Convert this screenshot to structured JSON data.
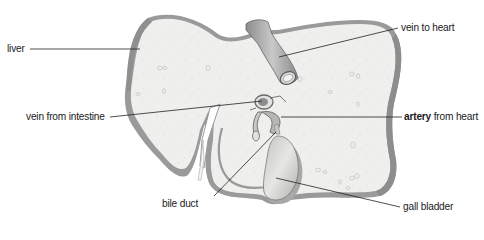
{
  "diagram": {
    "colors": {
      "background": "#ffffff",
      "liver_fill": "#efefed",
      "liver_rim": "#9a9a9a",
      "vessel_fill": "#b8b8b8",
      "vessel_dark": "#7a7a7a",
      "gall_bladder_fill": "#d8d8d6",
      "leader_line": "#222222",
      "text": "#1a1a1a"
    },
    "labels": {
      "liver": "liver",
      "vein_to_heart": "vein to heart",
      "vein_from_intestine": "vein from intestine",
      "artery_from_heart_bold": "artery",
      "artery_from_heart_rest": " from heart",
      "bile_duct": "bile duct",
      "gall_bladder": "gall bladder"
    },
    "parts": [
      {
        "name": "liver",
        "label": "liver"
      },
      {
        "name": "vein to heart",
        "label": "vein to heart"
      },
      {
        "name": "vein from intestine",
        "label": "vein from intestine"
      },
      {
        "name": "artery from heart",
        "label": "artery from heart",
        "emphasis": "artery"
      },
      {
        "name": "bile duct",
        "label": "bile duct"
      },
      {
        "name": "gall bladder",
        "label": "gall bladder"
      }
    ]
  }
}
